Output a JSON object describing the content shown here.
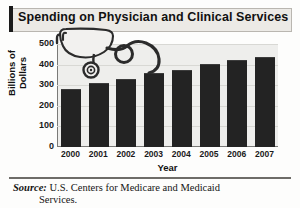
{
  "chart_data": {
    "type": "bar",
    "title": "Spending on Physician and Clinical Services",
    "xlabel": "Year",
    "ylabel": "Billions of Dollars",
    "categories": [
      "2000",
      "2001",
      "2002",
      "2003",
      "2004",
      "2005",
      "2006",
      "2007"
    ],
    "values": [
      280,
      310,
      332,
      358,
      373,
      404,
      420,
      435
    ],
    "ylim": [
      0,
      500
    ],
    "yticks": [
      500,
      400,
      300,
      200,
      100,
      0
    ],
    "grid": true,
    "legend": "none",
    "series_color": "#232323",
    "plot_background": "#eeeeec"
  },
  "title_band": {
    "title": "Spending on Physician and Clinical Services"
  },
  "decoration": {
    "graphic": "stethoscope-illustration"
  },
  "source": {
    "label": "Source:",
    "text": "U.S. Centers for Medicare and Medicaid",
    "continuation": "Services."
  }
}
